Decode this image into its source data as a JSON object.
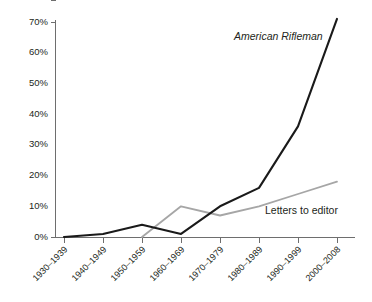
{
  "chart_data": {
    "type": "line",
    "title": "",
    "subtitle": "",
    "xlabel": "",
    "ylabel": "",
    "categories": [
      "1930–1939",
      "1940–1949",
      "1950–1959",
      "1960–1969",
      "1970–1979",
      "1980–1989",
      "1990–1999",
      "2000–2008"
    ],
    "ylim": [
      0,
      70
    ],
    "ytick_labels": [
      "0%",
      "10%",
      "20%",
      "30%",
      "40%",
      "50%",
      "60%",
      "70%"
    ],
    "ytick_values": [
      0,
      10,
      20,
      30,
      40,
      50,
      60,
      70
    ],
    "grid": false,
    "legend_position": "inline-annotation",
    "series": [
      {
        "name": "American Rifleman",
        "color": "#1a1a1a",
        "style": "italic",
        "x": [
          "1930–1939",
          "1940–1949",
          "1950–1959",
          "1960–1969",
          "1970–1979",
          "1980–1989",
          "1990–1999",
          "2000–2008"
        ],
        "values": [
          0,
          1,
          4,
          1,
          10,
          16,
          36,
          71
        ]
      },
      {
        "name": "Letters to editor",
        "color": "#a6a6a6",
        "style": "normal",
        "x": [
          "1950–1959",
          "1960–1969",
          "1970–1979",
          "1980–1989",
          "1990–1999",
          "2000–2008"
        ],
        "values": [
          0,
          10,
          7,
          10,
          14,
          18
        ]
      }
    ],
    "annotations": [
      {
        "text": "American Rifleman",
        "series": "American Rifleman"
      },
      {
        "text": "Letters to editor",
        "series": "Letters to editor"
      }
    ]
  }
}
